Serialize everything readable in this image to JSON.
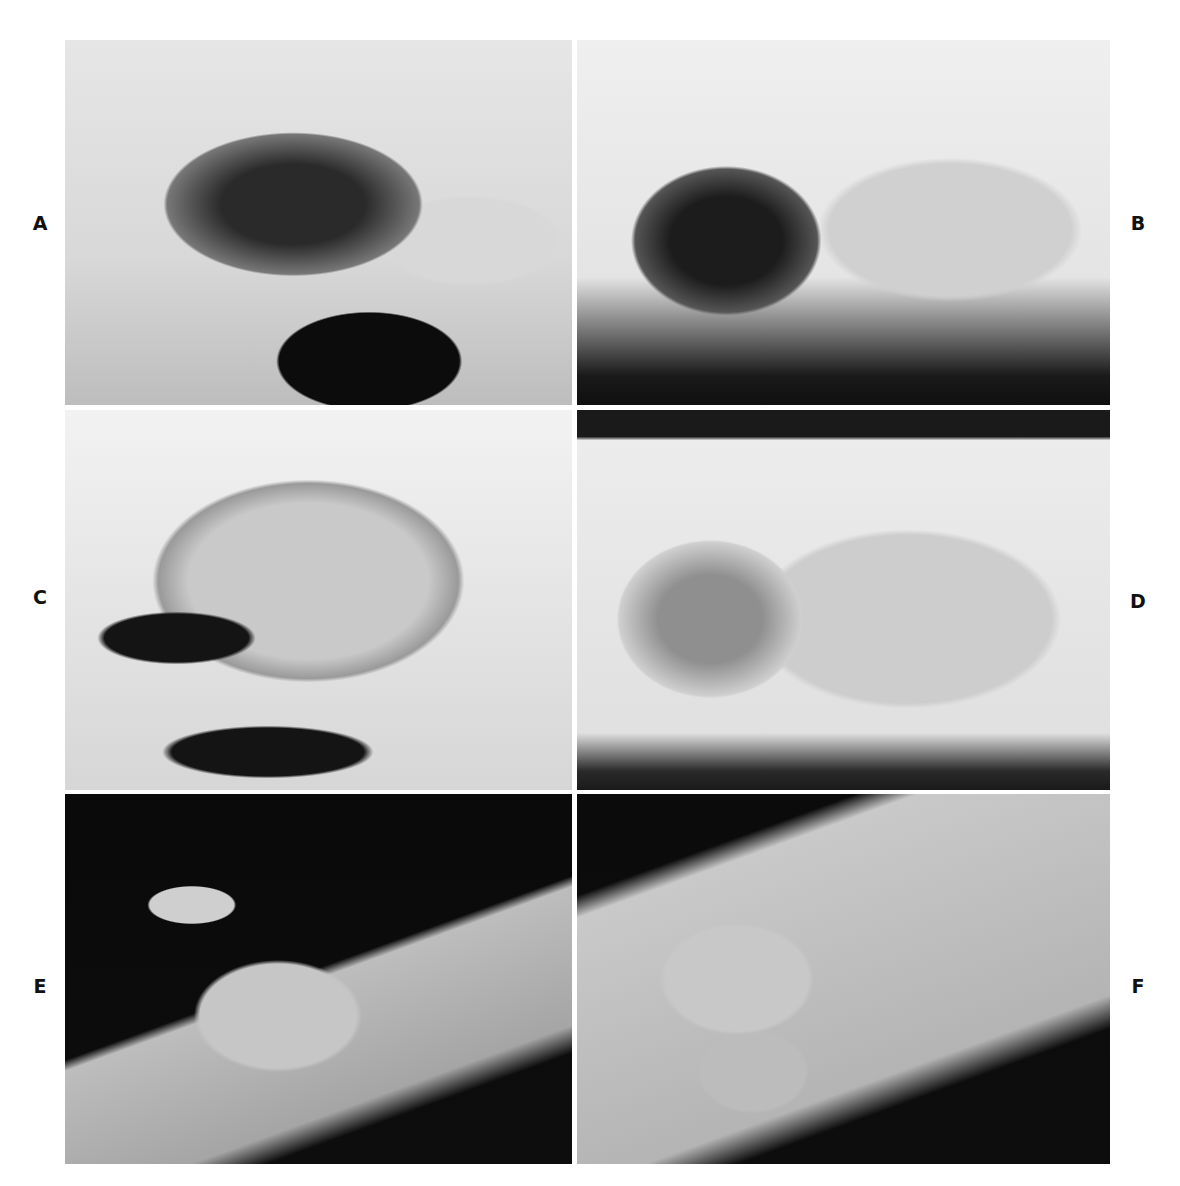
{
  "figure": {
    "panels": [
      {
        "id": "A",
        "label": "A",
        "description": "Severely mangled hand, dorsal view, immediately after injury"
      },
      {
        "id": "B",
        "label": "B",
        "description": "Severely mangled hand, palmar view, immediately after injury"
      },
      {
        "id": "C",
        "label": "C",
        "description": "Hand after suturing, dorsal view"
      },
      {
        "id": "D",
        "label": "D",
        "description": "Hand after suturing, palmar view"
      },
      {
        "id": "E",
        "label": "E",
        "description": "Healed reconstructed hand, lateral view on dark background"
      },
      {
        "id": "F",
        "label": "F",
        "description": "Healed reconstructed hand, palmar view on dark background"
      }
    ]
  }
}
